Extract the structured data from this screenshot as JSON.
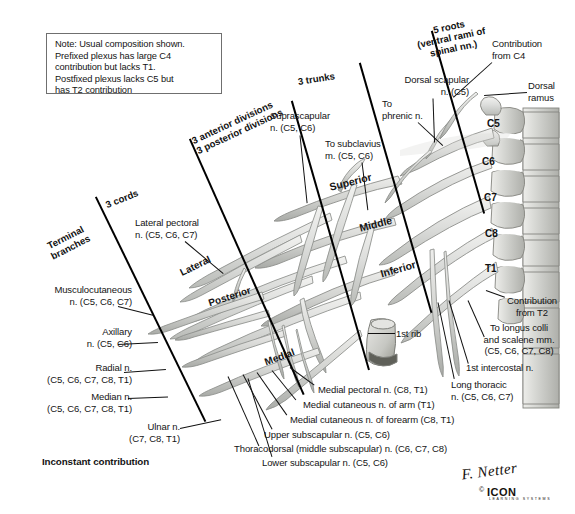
{
  "figure": {
    "note_box": {
      "lines": [
        "Note: Usual composition shown.",
        "Prefixed plexus has large C4",
        "contribution but lacks T1.",
        "Postfixed plexus lacks C5 but",
        "has T2 contribution"
      ]
    },
    "groups": [
      {
        "id": "roots",
        "label": "5 roots\n(ventral rami of\nspinal nn.)"
      },
      {
        "id": "trunks",
        "label": "3 trunks"
      },
      {
        "id": "divisions",
        "label": "3 anterior divisions\n3 posterior divisions"
      },
      {
        "id": "cords",
        "label": "3 cords"
      },
      {
        "id": "terminal",
        "label": "Terminal\nbranches"
      }
    ],
    "trunks": [
      {
        "name": "Superior"
      },
      {
        "name": "Middle"
      },
      {
        "name": "Inferior"
      }
    ],
    "cords": [
      {
        "name": "Lateral"
      },
      {
        "name": "Posterior"
      },
      {
        "name": "Medial"
      }
    ],
    "vertebral_levels": [
      "C5",
      "C6",
      "C7",
      "C8",
      "T1"
    ],
    "labels": {
      "dorsal_scapular": "Dorsal scapular\nn. (C5)",
      "contribution_c4": "Contribution\nfrom C4",
      "dorsal_ramus": "Dorsal\nramus",
      "to_phrenic": "To\nphrenic n.",
      "suprascapular": "Suprascapular\nn. (C5, C6)",
      "to_subclavius": "To subclavius\nm. (C5, C6)",
      "lateral_pectoral": "Lateral pectoral\nn. (C5, C6, C7)",
      "musculocutaneous": "Musculocutaneous\nn. (C5, C6, C7)",
      "axillary": "Axillary\nn. (C5, C6)",
      "radial": "Radial n.\n(C5, C6, C7, C8, T1)",
      "median": "Median n.\n(C5, C6, C7, C8, T1)",
      "ulnar": "Ulnar n.\n(C7, C8, T1)",
      "inconstant": "Inconstant contribution",
      "first_rib": "1st rib",
      "medial_pectoral": "Medial pectoral n. (C8, T1)",
      "medial_cut_arm": "Medial cutaneous n. of arm (T1)",
      "medial_cut_forearm": "Medial cutaneous n. of forearm (C8, T1)",
      "upper_subscapular": "Upper subscapular n. (C5, C6)",
      "thoracodorsal": "Thoracodorsal (middle subscapular) n. (C6, C7, C8)",
      "lower_subscapular": "Lower subscapular n. (C5, C6)",
      "contribution_t2": "Contribution\nfrom T2",
      "to_longus_colli": "To longus colli\nand scalene mm.\n(C5, C6, C7, C8)",
      "first_intercostal": "1st intercostal n.",
      "long_thoracic": "Long thoracic\nn. (C5, C6, C7)"
    },
    "credit": {
      "signature": "F. Netter",
      "logo": "ICON",
      "logo_sub": "LEARNING SYSTEMS",
      "copyright": "©"
    },
    "colors": {
      "ink": "#141414",
      "nerve_fill": "#d8d9d6",
      "nerve_stroke": "#8d8f8b",
      "bone_fill": "#cfd0cb",
      "bone_stroke": "#878884",
      "background": "#ffffff"
    }
  }
}
